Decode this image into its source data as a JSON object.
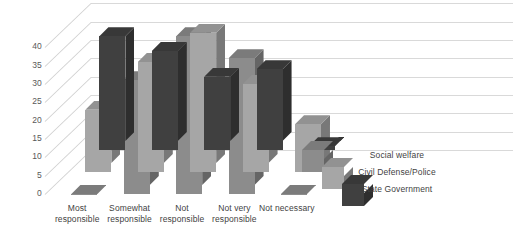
{
  "chart_data": {
    "type": "bar",
    "title": "",
    "subtitle": "",
    "xlabel": "",
    "ylabel": "",
    "ylim": [
      0,
      45
    ],
    "yticks": [
      0,
      5,
      10,
      15,
      20,
      25,
      30,
      35,
      40
    ],
    "grid": true,
    "three_d": true,
    "legend_position": "right",
    "categories": [
      "Most responsible",
      "Somewhat responsible",
      "Not responsible",
      "Not very responsible",
      "Not necessary"
    ],
    "category_lines": [
      [
        "Most",
        "responsible"
      ],
      [
        "Somewhat",
        "responsible"
      ],
      [
        "Not",
        "responsible"
      ],
      [
        "Not very",
        "responsible"
      ],
      [
        "Not necessary"
      ]
    ],
    "series": [
      {
        "name": "Social welfare",
        "color": "#8c8c8c",
        "values": [
          0,
          31,
          43,
          37,
          0
        ]
      },
      {
        "name": "Civil Defense/Police",
        "color": "#a6a6a6",
        "values": [
          17,
          30,
          38,
          24,
          13
        ]
      },
      {
        "name": "State Government",
        "color": "#404040",
        "values": [
          31,
          27,
          20,
          22,
          1
        ]
      }
    ]
  },
  "legend": {
    "items": [
      {
        "label": "Social welfare",
        "swatch": "legend-cube-social-welfare"
      },
      {
        "label": "Civil Defense/Police",
        "swatch": "legend-cube-civil-defense-police"
      },
      {
        "label": "State Government",
        "swatch": "legend-cube-state-government"
      }
    ]
  },
  "axis": {
    "y_tick_labels": [
      "0",
      "5",
      "10",
      "15",
      "20",
      "25",
      "30",
      "35",
      "40"
    ]
  }
}
